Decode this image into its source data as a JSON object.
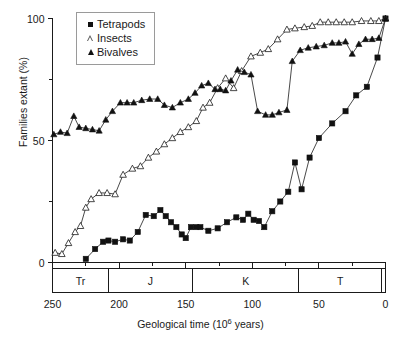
{
  "chart_data": {
    "type": "line",
    "title": "",
    "xlabel": "Geological time (10⁶ years)",
    "ylabel": "Families extant (%)",
    "xlim": [
      250,
      0
    ],
    "ylim": [
      0,
      100
    ],
    "x_ticks": [
      250,
      200,
      150,
      100,
      50,
      0
    ],
    "x_tick_labels": [
      "250",
      "200",
      "150",
      "100",
      "50",
      "0"
    ],
    "x_minor_ticks": [
      225,
      175,
      125,
      75,
      25
    ],
    "y_ticks": [
      0,
      50,
      100
    ],
    "y_tick_labels": [
      "0",
      "50",
      "100"
    ],
    "y_minor_ticks": [
      25,
      75
    ],
    "x_axis_inverted": true,
    "grid": false,
    "legend_position": "top-left-inside",
    "series": [
      {
        "name": "Tetrapods",
        "marker": "filled-square",
        "points": [
          [
            225,
            1.5
          ],
          [
            218,
            5.5
          ],
          [
            212,
            8.5
          ],
          [
            208,
            9.0
          ],
          [
            203,
            8.5
          ],
          [
            197,
            9.5
          ],
          [
            192,
            9.0
          ],
          [
            186,
            12.5
          ],
          [
            180,
            19.5
          ],
          [
            174,
            19.0
          ],
          [
            169,
            21.5
          ],
          [
            165,
            19.0
          ],
          [
            161,
            16.5
          ],
          [
            157,
            14.5
          ],
          [
            153,
            11.5
          ],
          [
            150,
            10.0
          ],
          [
            146,
            14.5
          ],
          [
            142,
            14.5
          ],
          [
            139,
            14.5
          ],
          [
            133,
            13.0
          ],
          [
            126,
            14.0
          ],
          [
            119,
            16.5
          ],
          [
            112,
            18.5
          ],
          [
            107,
            17.5
          ],
          [
            103,
            20.0
          ],
          [
            99,
            17.5
          ],
          [
            95,
            17.0
          ],
          [
            91,
            14.5
          ],
          [
            85,
            21.0
          ],
          [
            79,
            25.0
          ],
          [
            73,
            29.0
          ],
          [
            68,
            41.0
          ],
          [
            63,
            30.0
          ],
          [
            57,
            43.0
          ],
          [
            50,
            51.0
          ],
          [
            40,
            57.0
          ],
          [
            30,
            62.0
          ],
          [
            22,
            68.5
          ],
          [
            14,
            72.0
          ],
          [
            6,
            84.0
          ],
          [
            0,
            100.0
          ]
        ]
      },
      {
        "name": "Insects",
        "marker": "open-triangle",
        "points": [
          [
            248,
            4.0
          ],
          [
            243,
            3.5
          ],
          [
            238,
            8.0
          ],
          [
            233,
            12.5
          ],
          [
            229,
            15.0
          ],
          [
            225,
            22.5
          ],
          [
            221,
            26.0
          ],
          [
            215,
            28.5
          ],
          [
            209,
            28.5
          ],
          [
            203,
            28.0
          ],
          [
            197,
            36.0
          ],
          [
            190,
            38.5
          ],
          [
            184,
            39.5
          ],
          [
            178,
            43.0
          ],
          [
            172,
            45.5
          ],
          [
            166,
            48.5
          ],
          [
            160,
            51.0
          ],
          [
            154,
            53.5
          ],
          [
            148,
            55.5
          ],
          [
            142,
            58.0
          ],
          [
            137,
            63.5
          ],
          [
            132,
            65.5
          ],
          [
            126,
            71.5
          ],
          [
            120,
            75.5
          ],
          [
            114,
            71.5
          ],
          [
            108,
            78.5
          ],
          [
            101,
            84.5
          ],
          [
            94,
            86.0
          ],
          [
            88,
            87.5
          ],
          [
            81,
            91.5
          ],
          [
            74,
            95.5
          ],
          [
            68,
            96.0
          ],
          [
            61,
            96.5
          ],
          [
            55,
            97.0
          ],
          [
            49,
            98.5
          ],
          [
            43,
            98.5
          ],
          [
            37,
            98.5
          ],
          [
            31,
            98.5
          ],
          [
            25,
            98.5
          ],
          [
            18,
            99.0
          ],
          [
            11,
            99.0
          ],
          [
            5,
            99.0
          ],
          [
            0,
            100.0
          ]
        ]
      },
      {
        "name": "Bivalves",
        "marker": "filled-triangle",
        "points": [
          [
            249,
            52.5
          ],
          [
            244,
            53.5
          ],
          [
            239,
            53.0
          ],
          [
            234,
            60.0
          ],
          [
            230,
            55.5
          ],
          [
            225,
            55.0
          ],
          [
            220,
            54.5
          ],
          [
            215,
            54.0
          ],
          [
            210,
            58.5
          ],
          [
            205,
            62.0
          ],
          [
            199,
            65.5
          ],
          [
            194,
            65.5
          ],
          [
            189,
            65.5
          ],
          [
            183,
            66.5
          ],
          [
            177,
            67.0
          ],
          [
            171,
            67.0
          ],
          [
            166,
            64.5
          ],
          [
            160,
            63.5
          ],
          [
            154,
            65.5
          ],
          [
            148,
            67.0
          ],
          [
            143,
            69.5
          ],
          [
            138,
            72.5
          ],
          [
            133,
            73.5
          ],
          [
            128,
            71.0
          ],
          [
            124,
            71.0
          ],
          [
            120,
            70.5
          ],
          [
            116,
            74.5
          ],
          [
            111,
            79.0
          ],
          [
            106,
            78.0
          ],
          [
            101,
            77.0
          ],
          [
            96,
            62.0
          ],
          [
            90,
            60.5
          ],
          [
            85,
            60.5
          ],
          [
            80,
            61.5
          ],
          [
            74,
            62.5
          ],
          [
            70,
            82.5
          ],
          [
            64,
            87.0
          ],
          [
            58,
            88.0
          ],
          [
            52,
            88.5
          ],
          [
            46,
            89.0
          ],
          [
            40,
            90.0
          ],
          [
            35,
            90.0
          ],
          [
            30,
            90.5
          ],
          [
            25,
            85.5
          ],
          [
            20,
            89.5
          ],
          [
            15,
            91.5
          ],
          [
            10,
            91.5
          ],
          [
            5,
            92.0
          ],
          [
            0,
            100.0
          ]
        ]
      }
    ],
    "period_bands": [
      {
        "label": "Tr",
        "start": 250,
        "end": 208
      },
      {
        "label": "J",
        "start": 208,
        "end": 145
      },
      {
        "label": "K",
        "start": 145,
        "end": 65
      },
      {
        "label": "T",
        "start": 65,
        "end": 3
      },
      {
        "label": "",
        "start": 3,
        "end": 0
      }
    ]
  },
  "legend": {
    "items": [
      {
        "label": "Tetrapods",
        "symbol": "filled-square"
      },
      {
        "label": "Insects",
        "symbol": "open-triangle"
      },
      {
        "label": "Bivalves",
        "symbol": "filled-triangle"
      }
    ]
  },
  "colors": {
    "ink": "#1a1a1a",
    "marker_fill": "#111111",
    "background": "#ffffff"
  }
}
